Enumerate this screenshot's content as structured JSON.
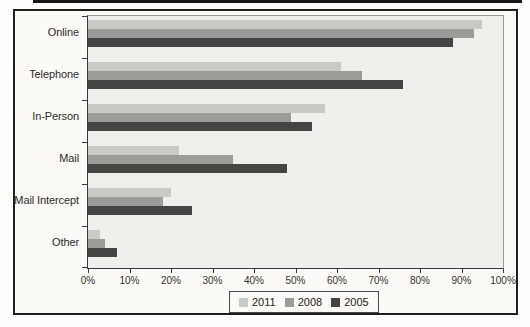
{
  "page": {
    "background": "#fdfdfb",
    "top_rule_color": "#161616"
  },
  "figure": {
    "border_color": "#1f1f1f",
    "background": "#fbfaf7",
    "plot_background": "#f0efeb"
  },
  "chart_data": {
    "type": "bar",
    "orientation": "horizontal",
    "title": "",
    "xlabel": "",
    "ylabel": "",
    "categories": [
      "Online",
      "Telephone",
      "In-Person",
      "Mail",
      "Mail Intercept",
      "Other"
    ],
    "series": [
      {
        "name": "2011",
        "color": "#c9c9c5",
        "values": [
          95,
          61,
          57,
          22,
          20,
          3
        ]
      },
      {
        "name": "2008",
        "color": "#9b9b97",
        "values": [
          93,
          66,
          49,
          35,
          18,
          4
        ]
      },
      {
        "name": "2005",
        "color": "#454543",
        "values": [
          88,
          76,
          54,
          48,
          25,
          7
        ]
      }
    ],
    "xlim": [
      0,
      100
    ],
    "x_ticks": [
      "0%",
      "10%",
      "20%",
      "30%",
      "40%",
      "50%",
      "60%",
      "70%",
      "80%",
      "90%",
      "100%"
    ],
    "grid": false,
    "legend_position": "bottom-center"
  }
}
